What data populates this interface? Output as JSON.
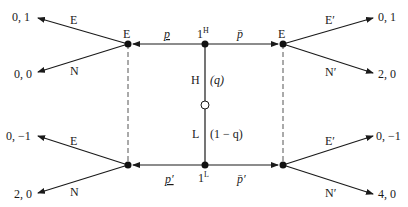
{
  "diagram": {
    "type": "signaling game tree",
    "nature_node": {
      "shape": "open-circle"
    },
    "types": {
      "high": {
        "node_label": "1",
        "sup": "H",
        "branch_label": "H",
        "prob": "(q)"
      },
      "low": {
        "node_label": "1",
        "sup": "L",
        "branch_label": "L",
        "prob": "(1 − q)"
      }
    },
    "signals": {
      "high_left": "p",
      "high_right": "p̄",
      "low_left": "p′",
      "low_right": "p̄′"
    },
    "receiver_nodes": {
      "left_top": "E",
      "right_top": "E"
    },
    "actions": {
      "left_top": {
        "up": "E",
        "down": "N"
      },
      "left_bottom": {
        "up": "E",
        "down": "N"
      },
      "right_top": {
        "up": "E′",
        "down": "N′"
      },
      "right_bottom": {
        "up": "E′",
        "down": "N′"
      }
    },
    "payoffs": {
      "left_top_E": "0, 1",
      "left_top_N": "0, 0",
      "left_bottom_E": "0, −1",
      "left_bottom_N": "2, 0",
      "right_top_E": "0, 1",
      "right_top_N": "2, 0",
      "right_bottom_E": "0, −1",
      "right_bottom_N": "4, 0"
    },
    "colors": {
      "line": "#1a1a1a",
      "dashed": "#555555"
    }
  }
}
